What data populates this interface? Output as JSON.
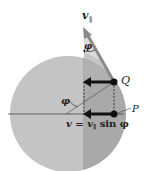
{
  "diagram": {
    "labels": {
      "v_parallel": "v",
      "v_parallel_sub": "∥",
      "phi_top": "φ",
      "phi_left": "φ",
      "point_Q": "Q",
      "point_P": "P",
      "equation_lhs": "v = v",
      "equation_sub": "∥",
      "equation_rhs": " sin φ"
    },
    "colors": {
      "circle_light": "#c4c4c4",
      "circle_dark": "#a9a9a9",
      "wedge": "#dcdcdc",
      "arrow_gray": "#8a8a8a",
      "arrow_black": "#111111",
      "line": "#444444"
    }
  }
}
